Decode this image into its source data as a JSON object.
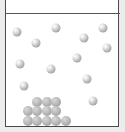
{
  "diagram": {
    "colors": {
      "background": "#ececec",
      "container_fill": "#ffffff",
      "border": "#4a4a4a",
      "free_particle": "#c8c8c8",
      "packed_particle": "#b0b0b0"
    },
    "free_particles": [
      {
        "x": 17,
        "y": 32
      },
      {
        "x": 56,
        "y": 28
      },
      {
        "x": 36,
        "y": 43
      },
      {
        "x": 103,
        "y": 28
      },
      {
        "x": 84,
        "y": 38
      },
      {
        "x": 107,
        "y": 48
      },
      {
        "x": 77,
        "y": 58
      },
      {
        "x": 20,
        "y": 64
      },
      {
        "x": 51,
        "y": 69
      },
      {
        "x": 87,
        "y": 79
      },
      {
        "x": 24,
        "y": 86
      },
      {
        "x": 93,
        "y": 101
      }
    ],
    "packed_particles": {
      "rows": [
        {
          "y": 102,
          "x": [
            37,
            47,
            56
          ]
        },
        {
          "y": 111,
          "x": [
            28,
            37,
            47,
            56
          ]
        },
        {
          "y": 121,
          "x": [
            28,
            37,
            47,
            56,
            66
          ]
        }
      ],
      "count": 12
    },
    "free_particle_count": 12
  }
}
